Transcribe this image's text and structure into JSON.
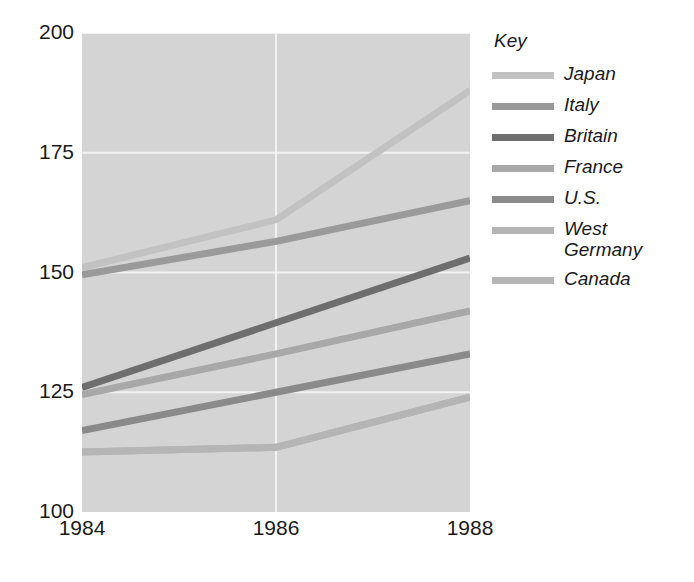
{
  "chart_data": {
    "type": "line",
    "title": "",
    "xlabel": "",
    "ylabel": "",
    "x": [
      1984,
      1986,
      1988
    ],
    "xticklabels": [
      "1984",
      "1986",
      "1988"
    ],
    "yticklabels": [
      "100",
      "125",
      "150",
      "175",
      "200"
    ],
    "yticks": [
      100,
      125,
      150,
      175,
      200
    ],
    "xlim": [
      1984,
      1988
    ],
    "ylim": [
      100,
      200
    ],
    "grid": true,
    "legend_position": "right",
    "legend_title": "Key",
    "plot_background": "#d4d4d4",
    "gridline_color": "#f2f2f2",
    "series": [
      {
        "name": "Japan",
        "values": [
          151,
          161,
          188
        ],
        "color": "#c2c2c2"
      },
      {
        "name": "Italy",
        "values": [
          149.5,
          156.5,
          165
        ],
        "color": "#9a9a9a"
      },
      {
        "name": "Britain",
        "values": [
          126,
          139.5,
          153
        ],
        "color": "#6e6e6e"
      },
      {
        "name": "France",
        "values": [
          124.5,
          133,
          142
        ],
        "color": "#a8a8a8"
      },
      {
        "name": "U.S.",
        "values": [
          117,
          125,
          133
        ],
        "color": "#8a8a8a"
      },
      {
        "name": "West\nGermany",
        "values": [
          112.5,
          113.5,
          124
        ],
        "color": "#b5b5b5"
      },
      {
        "name": "Canada",
        "values": [
          112.5,
          113.5,
          124
        ],
        "color": "#b5b5b5"
      }
    ]
  },
  "axes": {
    "yticks": [
      {
        "label": "200",
        "value": 200
      },
      {
        "label": "175",
        "value": 175
      },
      {
        "label": "150",
        "value": 150
      },
      {
        "label": "125",
        "value": 125
      },
      {
        "label": "100",
        "value": 100
      }
    ],
    "xticks": [
      {
        "label": "1984",
        "value": 1984
      },
      {
        "label": "1986",
        "value": 1986
      },
      {
        "label": "1988",
        "value": 1988
      }
    ]
  },
  "legend": {
    "title": "Key",
    "items": [
      {
        "label": "Japan",
        "color": "#c2c2c2"
      },
      {
        "label": "Italy",
        "color": "#9a9a9a"
      },
      {
        "label": "Britain",
        "color": "#6e6e6e"
      },
      {
        "label": "France",
        "color": "#a8a8a8"
      },
      {
        "label": "U.S.",
        "color": "#8a8a8a"
      },
      {
        "label": "West\nGermany",
        "color": "#b5b5b5"
      },
      {
        "label": "Canada",
        "color": "#b5b5b5"
      }
    ]
  }
}
